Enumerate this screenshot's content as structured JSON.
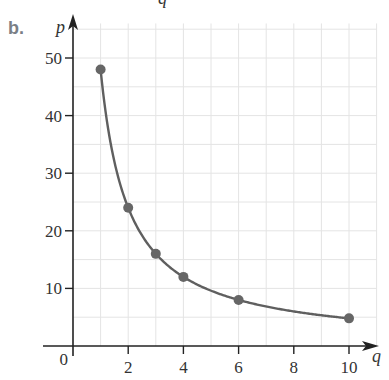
{
  "part_label": "b.",
  "top_fragment": "q",
  "chart_data": {
    "type": "line",
    "title": "",
    "xlabel": "q",
    "ylabel": "p",
    "x_ticks": [
      0,
      2,
      4,
      6,
      8,
      10
    ],
    "y_ticks": [
      10,
      20,
      30,
      40,
      50
    ],
    "x_tick_labels": [
      "0",
      "2",
      "4",
      "6",
      "8",
      "10"
    ],
    "y_tick_labels": [
      "10",
      "20",
      "30",
      "40",
      "50"
    ],
    "xlim": [
      0,
      11
    ],
    "ylim": [
      0,
      56
    ],
    "grid": true,
    "grid_x_step": 1,
    "grid_y_step": 5,
    "legend": null,
    "series": [
      {
        "name": "p = 48/q",
        "curve": "p = 48/q",
        "x": [
          1,
          2,
          3,
          4,
          6,
          10
        ],
        "values": [
          48,
          24,
          16,
          12,
          8,
          4.8
        ]
      }
    ],
    "colors": {
      "curve": "#5f5f5f",
      "points": "#666666",
      "grid": "#e4e4e4",
      "axis": "#222222"
    }
  }
}
